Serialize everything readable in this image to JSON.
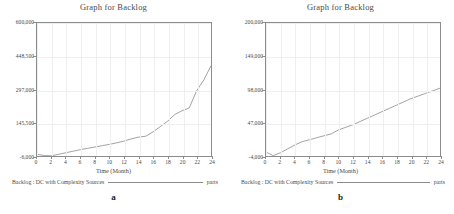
{
  "figure": {
    "panels": [
      {
        "id": "a",
        "caption": "a",
        "title": "Graph for Backlog",
        "xaxis_title": "Time (Month)",
        "legend_label": "Backlog : DC with Complexity Sources",
        "legend_unit": "parts",
        "ytick_labels": [
          "600,000",
          "448,500",
          "297,000",
          "145,500",
          "-6,000"
        ],
        "xtick_labels": [
          "0",
          "2",
          "4",
          "6",
          "8",
          "10",
          "12",
          "14",
          "16",
          "18",
          "20",
          "22",
          "24"
        ]
      },
      {
        "id": "b",
        "caption": "b",
        "title": "Graph for Backlog",
        "xaxis_title": "Time (Month)",
        "legend_label": "Backlog : DC with Complexity Sources",
        "legend_unit": "parts",
        "ytick_labels": [
          "200,000",
          "149,000",
          "98,000",
          "47,000",
          "-4,000"
        ],
        "xtick_labels": [
          "0",
          "2",
          "4",
          "6",
          "8",
          "10",
          "12",
          "14",
          "16",
          "18",
          "20",
          "22",
          "24"
        ]
      }
    ]
  },
  "colors": {
    "line": "#8c8c8c",
    "frame": "#8c8c8c",
    "grid": "#efefef",
    "text": "#4a4a4a",
    "background": "#ffffff"
  },
  "chart_data": [
    {
      "type": "line",
      "title": "Graph for Backlog",
      "xlabel": "Time (Month)",
      "ylabel": "parts",
      "series_name": "Backlog : DC with Complexity Sources",
      "xlim": [
        0,
        24
      ],
      "ylim": [
        -6000,
        600000
      ],
      "xticks": [
        0,
        2,
        4,
        6,
        8,
        10,
        12,
        14,
        16,
        18,
        20,
        22,
        24
      ],
      "yticks": [
        -6000,
        145500,
        297000,
        448500,
        600000
      ],
      "grid": true,
      "legend": "bottom",
      "x": [
        0,
        1,
        2,
        3,
        4,
        5,
        6,
        7,
        8,
        9,
        10,
        11,
        12,
        13,
        14,
        15,
        16,
        17,
        18,
        19,
        20,
        21,
        22,
        23,
        24
      ],
      "y": [
        2000,
        -4000,
        -5000,
        2000,
        9000,
        16000,
        23000,
        29000,
        35000,
        41000,
        47000,
        54000,
        62000,
        72000,
        80000,
        84000,
        104000,
        128000,
        152000,
        183000,
        200000,
        213000,
        290000,
        340000,
        405000
      ]
    },
    {
      "type": "line",
      "title": "Graph for Backlog",
      "xlabel": "Time (Month)",
      "ylabel": "parts",
      "series_name": "Backlog : DC with Complexity Sources",
      "xlim": [
        0,
        24
      ],
      "ylim": [
        -4000,
        200000
      ],
      "xticks": [
        0,
        2,
        4,
        6,
        8,
        10,
        12,
        14,
        16,
        18,
        20,
        22,
        24
      ],
      "yticks": [
        -4000,
        47000,
        98000,
        149000,
        200000
      ],
      "grid": true,
      "legend": "bottom",
      "x": [
        0,
        1,
        2,
        3,
        4,
        5,
        6,
        7,
        8,
        9,
        10,
        11,
        12,
        13,
        14,
        15,
        16,
        17,
        18,
        19,
        20,
        21,
        22,
        23,
        24
      ],
      "y": [
        2000,
        -3500,
        1000,
        7000,
        13000,
        18000,
        21000,
        24000,
        27000,
        30000,
        36000,
        40000,
        44000,
        49000,
        54000,
        59000,
        64000,
        69000,
        74000,
        79000,
        84000,
        88000,
        92000,
        96000,
        100000
      ]
    }
  ]
}
